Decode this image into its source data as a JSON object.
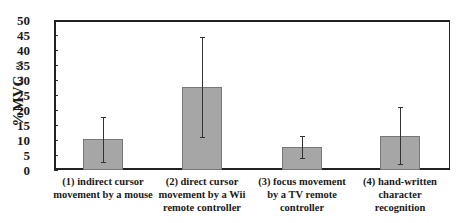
{
  "chart_data": {
    "type": "bar",
    "title": "",
    "xlabel": "",
    "ylabel": "%MVC",
    "ylabel_unit": "%",
    "ylim": [
      0,
      50
    ],
    "yticks": [
      0,
      5,
      10,
      15,
      20,
      25,
      30,
      35,
      40,
      45,
      50
    ],
    "grid": false,
    "legend": null,
    "categories": [
      [
        "(1) indirect cursor",
        "movement by a mouse"
      ],
      [
        "(2) direct cursor",
        "movement by a Wii",
        "remote controller"
      ],
      [
        "(3) focus movement",
        "by a TV remote",
        "controller"
      ],
      [
        "(4) hand-written",
        "character",
        "recognition"
      ]
    ],
    "values": [
      10.3,
      27.8,
      7.8,
      11.3
    ],
    "error_bars": [
      {
        "low": 2.7,
        "high": 17.7
      },
      {
        "low": 11.0,
        "high": 44.3
      },
      {
        "low": 4.0,
        "high": 11.3
      },
      {
        "low": 2.0,
        "high": 21.0
      }
    ],
    "bar_color": "#a6a6a6"
  }
}
